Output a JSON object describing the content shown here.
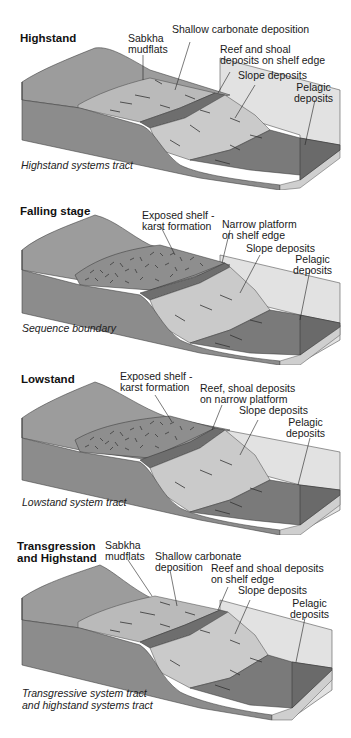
{
  "header": {
    "cutoff_text": "~ ~~ ~~ ~ ~~ ~ ~~ ~~ ~~ ~~~ ~~ ~~ ~ ~~ ~~~ ~"
  },
  "colors": {
    "land_top": "#9a9a9a",
    "land_side": "#8a8a8a",
    "shelf_light": "#b8b8b8",
    "reef_dark": "#6e6e6e",
    "slope_light": "#c8c8c8",
    "pelagic_dark": "#7a7a7a",
    "water_box": "#dcdcdc",
    "base_strip": "#cfcfcf",
    "line": "#333333"
  },
  "panels": [
    {
      "title": "Highstand",
      "labels": [
        {
          "text": "Sabkha\nmudflats"
        },
        {
          "text": "Shallow carbonate deposition"
        },
        {
          "text": "Reef and shoal\ndeposits on shelf edge"
        },
        {
          "text": "Slope deposits"
        },
        {
          "text": "Pelagic\ndeposits"
        }
      ],
      "caption": "Highstand systems tract"
    },
    {
      "title": "Falling stage",
      "labels": [
        {
          "text": "Exposed shelf -\nkarst formation"
        },
        {
          "text": "Narrow platform\non shelf edge"
        },
        {
          "text": "Slope deposits"
        },
        {
          "text": "Pelagic\ndeposits"
        }
      ],
      "caption": "Sequence boundary"
    },
    {
      "title": "Lowstand",
      "labels": [
        {
          "text": "Exposed shelf -\nkarst formation"
        },
        {
          "text": "Reef, shoal deposits\non narrow platform"
        },
        {
          "text": "Slope deposits"
        },
        {
          "text": "Pelagic\ndeposits"
        }
      ],
      "caption": "Lowstand system tract"
    },
    {
      "title": "Transgression\nand Highstand",
      "labels": [
        {
          "text": "Sabkha\nmudflats"
        },
        {
          "text": "Shallow carbonate\ndeposition"
        },
        {
          "text": "Reef and shoal deposits\non shelf edge"
        },
        {
          "text": "Slope deposits"
        },
        {
          "text": "Pelagic\ndeposits"
        }
      ],
      "caption": "Transgressive system tract\nand highstand systems tract"
    }
  ]
}
